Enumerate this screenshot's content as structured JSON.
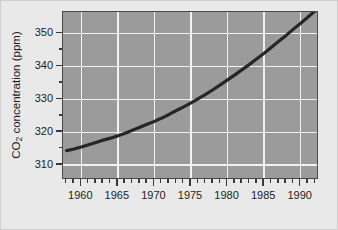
{
  "chart_data": {
    "type": "line",
    "title": "",
    "xlabel": "",
    "ylabel": "CO2 concentration (ppm)",
    "ylabel_parts": {
      "pre": "CO",
      "sub": "2",
      "post": " concentration (ppm)"
    },
    "xlim": [
      1957.5,
      1992.5
    ],
    "ylim": [
      305.5,
      356.5
    ],
    "grid": true,
    "legend": null,
    "x_major_ticks": [
      1960,
      1965,
      1970,
      1975,
      1980,
      1985,
      1990
    ],
    "x_major_tick_labels": [
      "1960",
      "1965",
      "1970",
      "1975",
      "1980",
      "1985",
      "1990"
    ],
    "x_minor_tick_step": 1,
    "y_major_ticks": [
      310,
      320,
      330,
      340,
      350
    ],
    "y_major_tick_labels": [
      "310",
      "320",
      "330",
      "340",
      "350"
    ],
    "y_minor_ticks": [
      315,
      325,
      335,
      345
    ],
    "series": [
      {
        "name": "CO2 concentration",
        "color": "#262626",
        "linewidth": 3.2,
        "x": [
          1958,
          1959,
          1960,
          1961,
          1962,
          1963,
          1964,
          1965,
          1966,
          1967,
          1968,
          1969,
          1970,
          1971,
          1972,
          1973,
          1974,
          1975,
          1976,
          1977,
          1978,
          1979,
          1980,
          1981,
          1982,
          1983,
          1984,
          1985,
          1986,
          1987,
          1988,
          1989,
          1990,
          1991,
          1992
        ],
        "values": [
          314.4,
          314.9,
          315.5,
          316.2,
          316.9,
          317.6,
          318.2,
          318.9,
          319.7,
          320.6,
          321.5,
          322.4,
          323.3,
          324.3,
          325.4,
          326.6,
          327.7,
          328.9,
          330.2,
          331.5,
          332.9,
          334.4,
          335.9,
          337.4,
          339.0,
          340.6,
          342.3,
          344.0,
          345.8,
          347.6,
          349.4,
          351.3,
          353.1,
          355.0,
          356.9
        ]
      }
    ],
    "plot_background_color": "#9b9b9b",
    "gridline_color": "#f2f2f2",
    "axis_color": "#4a4a4a",
    "figure_background_color": "#e9e9e9"
  }
}
